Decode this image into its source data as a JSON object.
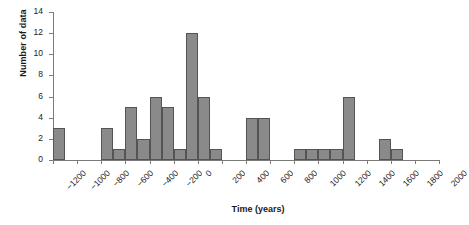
{
  "chart_data": {
    "type": "bar",
    "title": "",
    "xlabel": "Time (years)",
    "ylabel": "Number of data",
    "xlim": [
      -1200,
      2000
    ],
    "ylim": [
      0,
      14
    ],
    "bin_width": 100,
    "grid": false,
    "legend": null,
    "bar_color": "#8a8a8a",
    "bar_edge_color": "#545454",
    "axis_color": "#7b7b7b",
    "xticks": [
      -1200,
      -1000,
      -800,
      -600,
      -400,
      -200,
      0,
      200,
      400,
      600,
      800,
      1000,
      1200,
      1400,
      1600,
      1800,
      2000
    ],
    "xticklabels": [
      "−1200",
      "−1000",
      "−800",
      "−600",
      "−400",
      "−200",
      "0",
      "200",
      "400",
      "600",
      "800",
      "1000",
      "1200",
      "1400",
      "1600",
      "1800",
      "2000"
    ],
    "yticks": [
      0,
      2,
      4,
      6,
      8,
      10,
      12,
      14
    ],
    "yticklabels": [
      "0",
      "2",
      "4",
      "6",
      "8",
      "10",
      "12",
      "14"
    ],
    "bins": [
      {
        "start": -1200,
        "end": -1100,
        "value": 3
      },
      {
        "start": -1100,
        "end": -1000,
        "value": 0
      },
      {
        "start": -1000,
        "end": -900,
        "value": 0
      },
      {
        "start": -900,
        "end": -800,
        "value": 0
      },
      {
        "start": -800,
        "end": -700,
        "value": 3
      },
      {
        "start": -700,
        "end": -600,
        "value": 1
      },
      {
        "start": -600,
        "end": -500,
        "value": 5
      },
      {
        "start": -500,
        "end": -400,
        "value": 2
      },
      {
        "start": -400,
        "end": -300,
        "value": 6
      },
      {
        "start": -300,
        "end": -200,
        "value": 5
      },
      {
        "start": -200,
        "end": -100,
        "value": 1
      },
      {
        "start": -100,
        "end": 0,
        "value": 12
      },
      {
        "start": 0,
        "end": 100,
        "value": 6
      },
      {
        "start": 100,
        "end": 200,
        "value": 1
      },
      {
        "start": 200,
        "end": 300,
        "value": 0
      },
      {
        "start": 300,
        "end": 400,
        "value": 0
      },
      {
        "start": 400,
        "end": 500,
        "value": 4
      },
      {
        "start": 500,
        "end": 600,
        "value": 4
      },
      {
        "start": 600,
        "end": 700,
        "value": 0
      },
      {
        "start": 700,
        "end": 800,
        "value": 0
      },
      {
        "start": 800,
        "end": 900,
        "value": 1
      },
      {
        "start": 900,
        "end": 1000,
        "value": 1
      },
      {
        "start": 1000,
        "end": 1100,
        "value": 1
      },
      {
        "start": 1100,
        "end": 1200,
        "value": 1
      },
      {
        "start": 1200,
        "end": 1300,
        "value": 6
      },
      {
        "start": 1300,
        "end": 1400,
        "value": 0
      },
      {
        "start": 1400,
        "end": 1500,
        "value": 0
      },
      {
        "start": 1500,
        "end": 1600,
        "value": 2
      },
      {
        "start": 1600,
        "end": 1700,
        "value": 1
      },
      {
        "start": 1700,
        "end": 1800,
        "value": 0
      },
      {
        "start": 1800,
        "end": 1900,
        "value": 0
      },
      {
        "start": 1900,
        "end": 2000,
        "value": 0
      }
    ]
  }
}
